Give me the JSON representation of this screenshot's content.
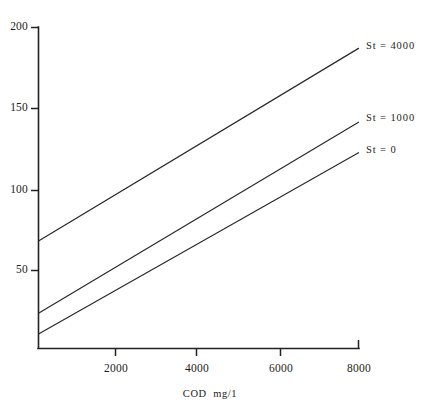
{
  "chart_data": {
    "type": "line",
    "title": "",
    "xlabel": "COD  mg/1",
    "ylabel": "",
    "xlim": [
      0,
      8250
    ],
    "ylim": [
      0,
      200
    ],
    "grid": false,
    "legend_position": "right-inline-labels",
    "x_ticks": [
      {
        "value": 2000,
        "label": "2000"
      },
      {
        "value": 4000,
        "label": "4000"
      },
      {
        "value": 6000,
        "label": "6000"
      },
      {
        "value": 8000,
        "label": "8000"
      }
    ],
    "y_ticks": [
      {
        "value": 50,
        "label": "50"
      },
      {
        "value": 100,
        "label": "100"
      },
      {
        "value": 150,
        "label": "150"
      },
      {
        "value": 200,
        "label": "200"
      }
    ],
    "series": [
      {
        "name": "St = 4000",
        "label": "St = 4000",
        "x": [
          0,
          8000
        ],
        "values": [
          67,
          187
        ],
        "label_x": 8000,
        "label_y": 187
      },
      {
        "name": "St = 1000",
        "label": "St = 1000",
        "x": [
          0,
          8000
        ],
        "values": [
          22,
          141
        ],
        "label_x": 8000,
        "label_y": 141
      },
      {
        "name": "St = 0",
        "label": "St = 0",
        "x": [
          0,
          8000
        ],
        "values": [
          9,
          122
        ],
        "label_x": 8000,
        "label_y": 122
      }
    ],
    "colors": {
      "background": "#ffffff",
      "axis": "#222222",
      "line": "#2b2b2b",
      "text": "#1c1c1c"
    }
  },
  "axes": {
    "y_tick_200": "200",
    "y_tick_150": "150",
    "y_tick_100": "100",
    "y_tick_50": "50",
    "x_tick_2000": "2000",
    "x_tick_4000": "4000",
    "x_tick_6000": "6000",
    "x_tick_8000": "8000",
    "x_axis_title": "COD  mg/1"
  },
  "series_labels": {
    "top": "St = 4000",
    "middle": "St = 1000",
    "bottom": "St = 0"
  }
}
